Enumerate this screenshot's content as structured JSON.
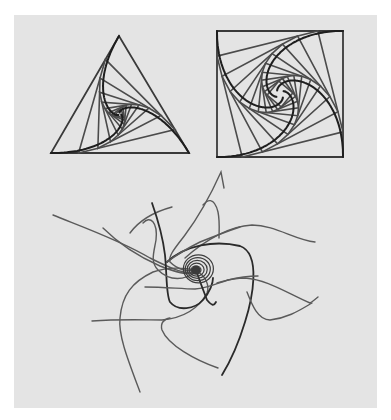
{
  "figure": {
    "background": "#e4e4e4",
    "line_color": "#4b4b4b",
    "curve_color": "#1e1e1e"
  },
  "triangle_spiral": {
    "vertices": [
      [
        51,
        153
      ],
      [
        189,
        153
      ],
      [
        119,
        36
      ]
    ],
    "t": 0.2,
    "levels": 9
  },
  "square_spiral": {
    "vertices": [
      [
        343,
        31
      ],
      [
        217,
        31
      ],
      [
        217,
        157
      ],
      [
        343,
        157
      ]
    ],
    "t": 0.2,
    "levels": 11
  },
  "vortex": {
    "center": [
      196,
      270
    ],
    "rings": [
      4,
      6.5,
      9,
      11.5,
      14
    ]
  },
  "flow_lines": [
    {
      "d": "M53,215 C80,226 120,240 150,258 C170,268 185,275 196,272",
      "dark": false
    },
    {
      "d": "M103,228 C115,240 135,255 160,266 C175,272 188,276 196,272",
      "dark": false
    },
    {
      "d": "M224,188 L221,172 C212,192 200,215 185,235 C175,248 168,256 170,262 C178,270 188,272 196,270",
      "dark": false
    },
    {
      "d": "M203,205 C207,200 214,196 218,212 C220,222 219,232 219,238",
      "dark": false
    },
    {
      "d": "M185,258 C205,240 230,226 252,225 C275,225 295,240 315,242",
      "dark": false
    },
    {
      "d": "M167,262 C185,245 215,240 240,246 C262,254 252,300 245,322 C238,345 230,362 222,375",
      "dark": true
    },
    {
      "d": "M318,297 C312,302 310,303 310,303 C285,292 268,280 245,278 C230,278 222,282 217,283",
      "dark": false
    },
    {
      "d": "M247,292 C252,305 258,320 270,320 C288,318 300,310 312,303",
      "dark": false
    },
    {
      "d": "M140,392 C128,360 118,335 120,318 C122,295 132,282 153,272 C170,266 185,268 196,270",
      "dark": false
    },
    {
      "d": "M92,321 C120,319 145,320 162,320 C182,318 198,310 207,293 C210,285 205,276 198,272",
      "dark": false
    },
    {
      "d": "M218,368 C195,360 168,345 162,330 C160,323 164,319 170,318",
      "dark": false
    },
    {
      "d": "M130,233 C138,222 150,213 172,207",
      "dark": false
    },
    {
      "d": "M152,203 C158,220 163,238 165,255 C167,275 166,295 170,302 C178,312 195,309 203,300 C210,292 213,283 213,278",
      "dark": true
    },
    {
      "d": "M145,287 C165,287 182,289 195,289 C208,288 218,283 228,280",
      "dark": false
    },
    {
      "d": "M143,223 C150,215 158,222 156,240 C154,252 150,262 158,270 C170,282 185,280 196,272",
      "dark": false
    },
    {
      "d": "M196,270 C200,282 204,292 207,300 C212,306 214,306 216,302",
      "dark": true
    },
    {
      "d": "M240,227 C225,232 210,238 200,242 C188,248 175,256 167,262",
      "dark": false
    },
    {
      "d": "M228,280 C236,278 245,276 258,276",
      "dark": false
    }
  ]
}
